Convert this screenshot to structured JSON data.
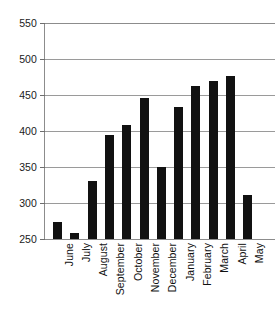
{
  "chart_data": {
    "type": "bar",
    "title": "",
    "subtitle": "",
    "xlabel": "",
    "ylabel": "",
    "categories": [
      "June",
      "July",
      "August",
      "September",
      "October",
      "November",
      "December",
      "January",
      "February",
      "March",
      "April",
      "May"
    ],
    "values": [
      274,
      259,
      330,
      394,
      409,
      446,
      350,
      433,
      463,
      470,
      477,
      311
    ],
    "series": [
      {
        "name": "",
        "values": [
          274,
          259,
          330,
          394,
          409,
          446,
          350,
          433,
          463,
          470,
          477,
          311
        ]
      }
    ],
    "ylim": [
      250,
      550
    ],
    "yticks": [
      250,
      300,
      350,
      400,
      450,
      500,
      550
    ],
    "ytick_labels": [
      "250",
      "300",
      "350",
      "400",
      "450",
      "500",
      "550"
    ],
    "grid": true,
    "grid_axis": "y",
    "legend": false,
    "legend_position": "none",
    "bar_color": "#111111",
    "grid_color": "#9a9a9a",
    "axis_color": "#8c8c8c",
    "background_color": "#ffffff",
    "xtick_rotation": -90,
    "annotations": []
  }
}
